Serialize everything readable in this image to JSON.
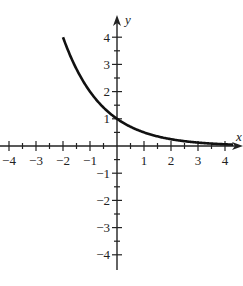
{
  "chart_data": {
    "type": "line",
    "title": "",
    "xlabel": "x",
    "ylabel": "y",
    "xlim": [
      -4.3,
      4.5
    ],
    "ylim": [
      -4.5,
      4.6
    ],
    "grid": false,
    "x_ticks": [
      "-4",
      "-3",
      "-2",
      "-1",
      "1",
      "2",
      "3",
      "4"
    ],
    "y_ticks": [
      "4",
      "3",
      "2",
      "1",
      "-1",
      "-2",
      "-3",
      "-4"
    ],
    "series": [
      {
        "name": "y = (1/2)^x",
        "x": [
          -2,
          -1.5,
          -1,
          -0.5,
          0,
          0.5,
          1,
          1.5,
          2,
          2.5,
          3,
          3.5,
          4
        ],
        "y": [
          4,
          2.83,
          2,
          1.41,
          1,
          0.71,
          0.5,
          0.35,
          0.25,
          0.18,
          0.125,
          0.09,
          0.0625
        ]
      }
    ]
  },
  "colors": {
    "curve": "#111111",
    "axes": "#222222"
  }
}
